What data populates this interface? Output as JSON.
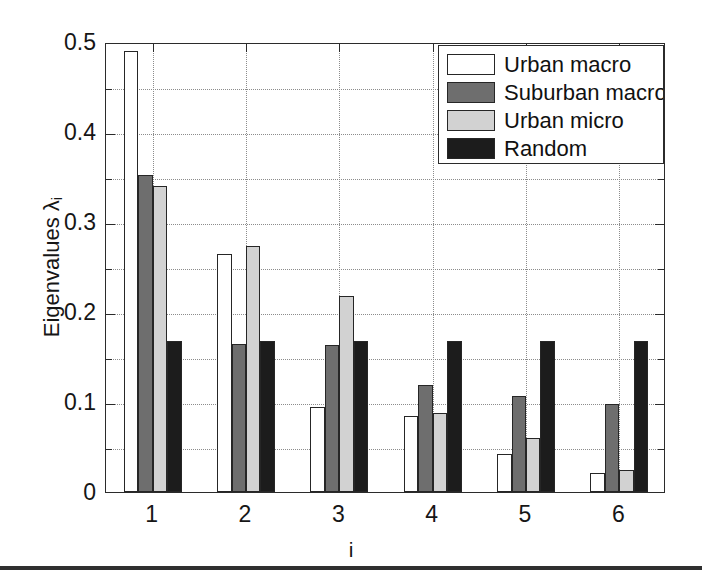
{
  "chart_data": {
    "type": "bar",
    "title": "",
    "xlabel": "i",
    "ylabel": "Eigenvalues λ",
    "ylabel_sub": "i",
    "categories": [
      "1",
      "2",
      "3",
      "4",
      "5",
      "6"
    ],
    "xtick_labels": [
      "1",
      "2",
      "3",
      "4",
      "5",
      "6"
    ],
    "ytick_labels": [
      "0",
      "0.1",
      "0.2",
      "0.3",
      "0.4",
      "0.5"
    ],
    "ytick_values": [
      0,
      0.1,
      0.2,
      0.3,
      0.4,
      0.5
    ],
    "yminor_values": [
      0.05,
      0.15,
      0.25,
      0.35,
      0.45
    ],
    "ylim": [
      0,
      0.5
    ],
    "xlim": [
      0.5,
      6.5
    ],
    "grid": true,
    "grid_style": "dotted",
    "legend_position": "top-right",
    "series": [
      {
        "name": "Urban macro",
        "color": "#ffffff",
        "edge": "#262626",
        "values": [
          0.49,
          0.264,
          0.095,
          0.085,
          0.042,
          0.021
        ]
      },
      {
        "name": "Suburban macro",
        "color": "#6e6e6e",
        "edge": "#262626",
        "values": [
          0.352,
          0.165,
          0.163,
          0.119,
          0.107,
          0.098
        ]
      },
      {
        "name": "Urban micro",
        "color": "#d2d2d2",
        "edge": "#262626",
        "values": [
          0.34,
          0.273,
          0.218,
          0.088,
          0.06,
          0.024
        ]
      },
      {
        "name": "Random",
        "color": "#1c1c1c",
        "edge": "#262626",
        "values": [
          0.168,
          0.168,
          0.168,
          0.168,
          0.168,
          0.168
        ]
      }
    ]
  },
  "legend": {
    "entries": [
      {
        "label": "Urban macro"
      },
      {
        "label": "Suburban macro"
      },
      {
        "label": "Urban micro"
      },
      {
        "label": "Random"
      }
    ]
  },
  "axes": {
    "x_title": "i",
    "y_title_main": "Eigenvalues λ",
    "y_title_sub": "i"
  }
}
